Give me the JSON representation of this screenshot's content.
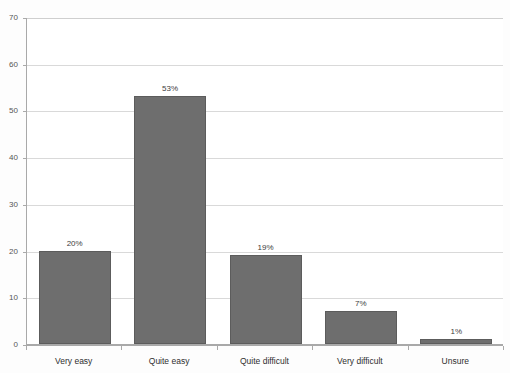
{
  "chart_data": {
    "type": "bar",
    "title": "",
    "xlabel": "",
    "ylabel": "",
    "categories": [
      "Very easy",
      "Quite easy",
      "Quite difficult",
      "Very difficult",
      "Unsure"
    ],
    "values": [
      20,
      53,
      19,
      7,
      1
    ],
    "data_labels": [
      "20%",
      "53%",
      "19%",
      "7%",
      "1%"
    ],
    "ylim": [
      0,
      70
    ],
    "y_ticks": [
      0,
      10,
      20,
      30,
      40,
      50,
      60,
      70
    ],
    "y_tick_labels": [
      "0",
      "10",
      "20",
      "30",
      "40",
      "50",
      "60",
      "70"
    ],
    "grid": true,
    "grid_axis": "y",
    "legend": false,
    "legend_position": "none",
    "bar_color": "#6e6e6e",
    "bar_border_color": "#5c5c5c",
    "gridline_color": "#d9d9d9",
    "axis_color": "#a9a9a9",
    "plot_background": "#ffffff",
    "figure_background": "#fdfdfd",
    "units": "percent"
  },
  "title_fragment": {
    "text": ""
  }
}
